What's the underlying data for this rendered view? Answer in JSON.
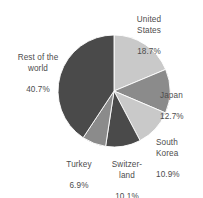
{
  "chart_data": {
    "type": "pie",
    "title": "",
    "subtitle": "",
    "xlabel": "",
    "ylabel": "",
    "legend_position": "none",
    "grid": false,
    "start_angle_deg": 0,
    "direction": "clockwise",
    "unit": "%",
    "categories": [
      "United States",
      "Japan",
      "South Korea",
      "Switzerland",
      "Turkey",
      "Rest of the world"
    ],
    "values": [
      18.7,
      12.7,
      10.9,
      10.1,
      6.9,
      40.7
    ],
    "slices": [
      {
        "id": "united-states",
        "label": "United\nStates",
        "label_plain": "United States",
        "value": 18.7,
        "value_text": "18.7%",
        "color": "#c9c9c9"
      },
      {
        "id": "japan",
        "label": "Japan",
        "label_plain": "Japan",
        "value": 12.7,
        "value_text": "12.7%",
        "color": "#8b8b8b"
      },
      {
        "id": "south-korea",
        "label": "South\nKorea",
        "label_plain": "South Korea",
        "value": 10.9,
        "value_text": "10.9%",
        "color": "#c9c9c9"
      },
      {
        "id": "switzerland",
        "label": "Switzer-\nland",
        "label_plain": "Switzerland",
        "value": 10.1,
        "value_text": "10.1%",
        "color": "#4a4a4a"
      },
      {
        "id": "turkey",
        "label": "Turkey",
        "label_plain": "Turkey",
        "value": 6.9,
        "value_text": "6.9%",
        "color": "#8b8b8b"
      },
      {
        "id": "rest-of-world",
        "label": "Rest of the\nworld",
        "label_plain": "Rest of the world",
        "value": 40.7,
        "value_text": "40.7%",
        "color": "#4a4a4a"
      }
    ],
    "geometry": {
      "center_x": 114,
      "center_y": 91,
      "radius": 56
    },
    "colors": {
      "light_gray": "#c9c9c9",
      "medium_gray": "#8b8b8b",
      "dark_gray": "#4a4a4a",
      "background": "#ffffff",
      "label_text": "#4d4d4d"
    }
  }
}
